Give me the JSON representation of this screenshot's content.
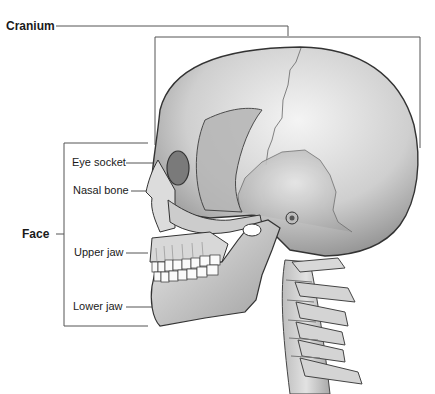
{
  "title_fragment": "...ography",
  "labels": {
    "cranium": "Cranium",
    "face": "Face",
    "eye_socket": "Eye socket",
    "nasal_bone": "Nasal bone",
    "upper_jaw": "Upper jaw",
    "lower_jaw": "Lower jaw"
  },
  "colors": {
    "line": "#555555",
    "bone_light": "#f2f2f2",
    "bone_mid": "#c8c8c8",
    "bone_dark": "#8a8a8a",
    "outline": "#333333"
  }
}
